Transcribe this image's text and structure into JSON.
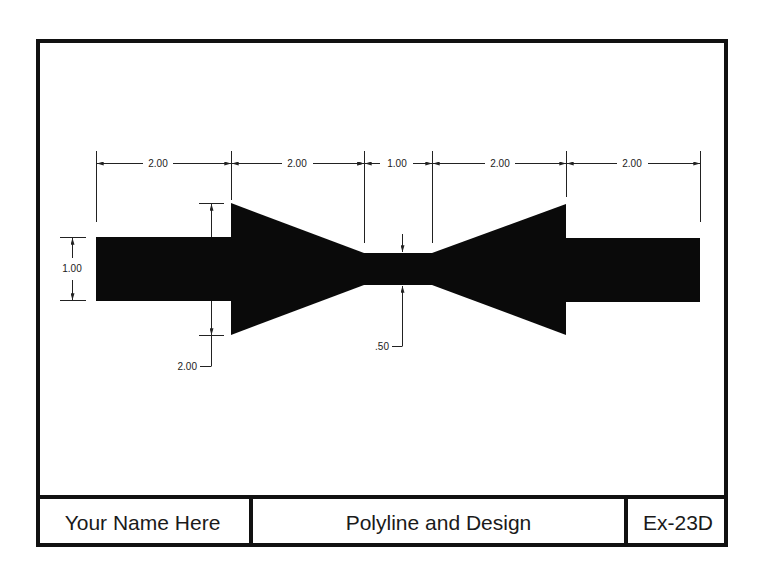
{
  "drawing": {
    "shape_color": "#0a0a0a",
    "line_color": "#222222",
    "dimensions": {
      "horizontal": [
        {
          "label": "2.00"
        },
        {
          "label": "2.00"
        },
        {
          "label": "1.00"
        },
        {
          "label": "2.00"
        },
        {
          "label": "2.00"
        }
      ],
      "end_height": "1.00",
      "flare_height": "2.00",
      "neck_height": ".50"
    }
  },
  "title_block": {
    "name": "Your Name Here",
    "title": "Polyline and Design",
    "number": "Ex-23D"
  }
}
